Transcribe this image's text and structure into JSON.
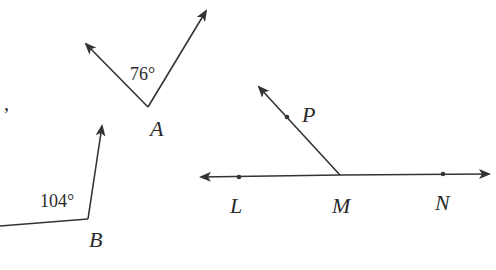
{
  "diagram": {
    "stroke_color": "#333333",
    "background": "#ffffff",
    "stray_mark": ",",
    "angle_A": {
      "vertex_label": "A",
      "measure_label": "76°",
      "measure": 76
    },
    "angle_B": {
      "vertex_label": "B",
      "measure_label": "104°",
      "measure": 104
    },
    "line_figure": {
      "points": [
        "L",
        "M",
        "N"
      ],
      "ray_point": "P",
      "labels": {
        "L": "L",
        "M": "M",
        "N": "N",
        "P": "P"
      }
    }
  }
}
